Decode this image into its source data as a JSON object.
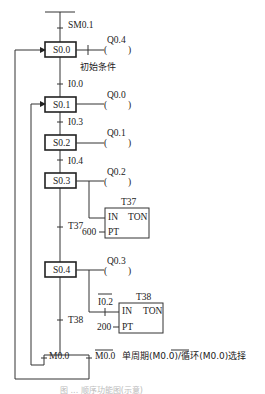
{
  "diagram": {
    "type": "sequential-function-chart",
    "initial_transition": "SM0.1",
    "steps": [
      {
        "id": "S0.0",
        "output": "Q0.4",
        "note": "初始条件"
      },
      {
        "id": "S0.1",
        "output": "Q0.0"
      },
      {
        "id": "S0.2",
        "output": "Q0.1"
      },
      {
        "id": "S0.3",
        "output": "Q0.2"
      },
      {
        "id": "S0.4",
        "output": "Q0.3"
      }
    ],
    "transitions": [
      {
        "from": "S0.0",
        "to": "S0.1",
        "label": "I0.0"
      },
      {
        "from": "S0.1",
        "to": "S0.2",
        "label": "I0.3"
      },
      {
        "from": "S0.2",
        "to": "S0.3",
        "label": "I0.4"
      },
      {
        "from": "S0.3",
        "to": "S0.4",
        "label": "T37"
      },
      {
        "from": "S0.4",
        "to": "branch",
        "label": "T38"
      }
    ],
    "timers": [
      {
        "name": "T37",
        "in_label": "IN",
        "type_label": "TON",
        "pt_label": "PT",
        "preset": "600"
      },
      {
        "name": "T38",
        "in_label": "IN",
        "type_label": "TON",
        "pt_label": "PT",
        "preset": "200",
        "in_contact": "I0.2",
        "in_contact_negated": true
      }
    ],
    "branch": {
      "left_condition": "M0.0",
      "right_condition": "M0.0",
      "right_condition_negated": true,
      "description_prefix": "单周期(",
      "description_neg": "M0.0",
      "description_mid": ")/循环(M0.0)选择"
    },
    "caption": "图 ... 顺序功能图(示意)"
  }
}
